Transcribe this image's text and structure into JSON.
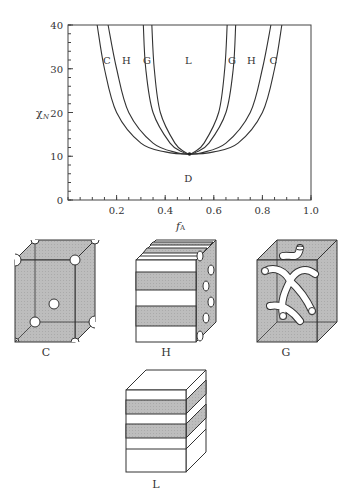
{
  "chart_data": {
    "type": "line",
    "title": "",
    "xlabel": "f_A",
    "ylabel": "χN",
    "xlim": [
      0,
      1.0
    ],
    "ylim": [
      0,
      40
    ],
    "x_ticks": [
      "0.2",
      "0.4",
      "0.6",
      "0.8",
      "1.0"
    ],
    "y_ticks": [
      "0",
      "10",
      "20",
      "30",
      "40"
    ],
    "grid": false,
    "critical_point": {
      "x": 0.5,
      "y": 10.5
    },
    "series": [
      {
        "name": "D-C boundary",
        "points": [
          [
            0.12,
            40
          ],
          [
            0.15,
            30
          ],
          [
            0.2,
            20
          ],
          [
            0.3,
            13
          ],
          [
            0.4,
            11
          ],
          [
            0.5,
            10.5
          ],
          [
            0.6,
            11
          ],
          [
            0.7,
            13
          ],
          [
            0.8,
            20
          ],
          [
            0.85,
            30
          ],
          [
            0.88,
            40
          ]
        ]
      },
      {
        "name": "C-H boundary",
        "points": [
          [
            0.165,
            40
          ],
          [
            0.2,
            30
          ],
          [
            0.25,
            20
          ],
          [
            0.35,
            13
          ],
          [
            0.45,
            10.8
          ],
          [
            0.5,
            10.5
          ],
          [
            0.55,
            10.8
          ],
          [
            0.65,
            13
          ],
          [
            0.75,
            20
          ],
          [
            0.8,
            30
          ],
          [
            0.835,
            40
          ]
        ]
      },
      {
        "name": "H-G boundary",
        "points": [
          [
            0.31,
            40
          ],
          [
            0.32,
            30
          ],
          [
            0.35,
            20
          ],
          [
            0.42,
            13
          ],
          [
            0.47,
            11
          ],
          [
            0.5,
            10.5
          ],
          [
            0.53,
            11
          ],
          [
            0.58,
            13
          ],
          [
            0.65,
            20
          ],
          [
            0.68,
            30
          ],
          [
            0.69,
            40
          ]
        ]
      },
      {
        "name": "G-L boundary",
        "points": [
          [
            0.345,
            40
          ],
          [
            0.355,
            30
          ],
          [
            0.38,
            20
          ],
          [
            0.44,
            13
          ],
          [
            0.48,
            11
          ],
          [
            0.5,
            10.5
          ],
          [
            0.52,
            11
          ],
          [
            0.56,
            13
          ],
          [
            0.62,
            20
          ],
          [
            0.645,
            30
          ],
          [
            0.655,
            40
          ]
        ]
      }
    ],
    "region_labels": [
      {
        "text": "C",
        "x": 0.16,
        "y": 32
      },
      {
        "text": "H",
        "x": 0.24,
        "y": 32
      },
      {
        "text": "G",
        "x": 0.325,
        "y": 32
      },
      {
        "text": "L",
        "x": 0.495,
        "y": 32
      },
      {
        "text": "G",
        "x": 0.675,
        "y": 32
      },
      {
        "text": "H",
        "x": 0.755,
        "y": 32
      },
      {
        "text": "C",
        "x": 0.845,
        "y": 32
      },
      {
        "text": "D",
        "x": 0.495,
        "y": 5
      }
    ]
  },
  "morphologies": {
    "C": "C",
    "H": "H",
    "G": "G",
    "L": "L"
  }
}
